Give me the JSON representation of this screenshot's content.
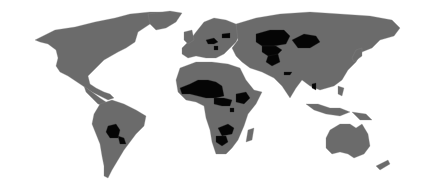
{
  "map": {
    "title": "",
    "colors": {
      "background": "#ffffff",
      "land": "#6b6b6b",
      "highlighted": "#050505",
      "border": "#8a8a8a"
    },
    "highlighted_regions": [
      "Mali",
      "Niger",
      "Chad",
      "Burkina Faso",
      "Central African Republic",
      "South Sudan",
      "Ethiopia",
      "Uganda",
      "Rwanda",
      "Burundi",
      "Zambia",
      "Malawi",
      "Zimbabwe",
      "Botswana",
      "Lesotho",
      "Eswatini",
      "Bolivia",
      "Paraguay",
      "Kazakhstan",
      "Uzbekistan",
      "Turkmenistan",
      "Kyrgyzstan",
      "Tajikistan",
      "Afghanistan",
      "Mongolia",
      "Nepal",
      "Bhutan",
      "Laos",
      "Belarus",
      "Czechia",
      "Austria",
      "Hungary",
      "Slovakia",
      "Serbia",
      "Switzerland",
      "Armenia",
      "Azerbaijan"
    ]
  }
}
